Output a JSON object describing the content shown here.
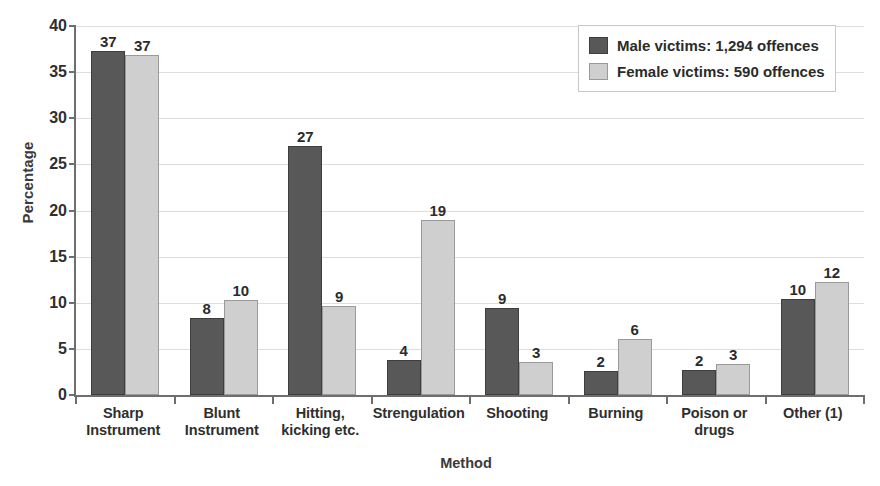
{
  "chart_data": {
    "type": "bar",
    "title": "",
    "xlabel": "Method",
    "ylabel": "Percentage",
    "ylim": [
      0,
      40
    ],
    "ytick_values": [
      0,
      5,
      10,
      15,
      20,
      25,
      30,
      35,
      40
    ],
    "ytick_labels": [
      "0",
      "5",
      "10",
      "15",
      "20",
      "25",
      "30",
      "35",
      "40"
    ],
    "grid": true,
    "legend_position": "top-right",
    "categories": [
      "Sharp Instrument",
      "Blunt Instrument",
      "Hitting, kicking etc.",
      "Strengulation",
      "Shooting",
      "Burning",
      "Poison or drugs",
      "Other (1)"
    ],
    "category_lines": [
      [
        "Sharp",
        "Instrument"
      ],
      [
        "Blunt",
        "Instrument"
      ],
      [
        "Hitting,",
        "kicking etc."
      ],
      [
        "Strengulation"
      ],
      [
        "Shooting"
      ],
      [
        "Burning"
      ],
      [
        "Poison or",
        "drugs"
      ],
      [
        "Other (1)"
      ]
    ],
    "series": [
      {
        "name": "Male victims: 1,294 offences",
        "short_name": "Male victims",
        "color": "#585858",
        "values": [
          37.3,
          8.3,
          27.0,
          3.8,
          9.4,
          2.6,
          2.7,
          10.4
        ],
        "labels": [
          "37",
          "8",
          "27",
          "4",
          "9",
          "2",
          "2",
          "10"
        ]
      },
      {
        "name": "Female victims: 590 offences",
        "short_name": "Female victims",
        "color": "#cfcfcf",
        "values": [
          36.9,
          10.3,
          9.7,
          19.0,
          3.6,
          6.1,
          3.4,
          12.2
        ],
        "labels": [
          "37",
          "10",
          "9",
          "19",
          "3",
          "6",
          "3",
          "12"
        ]
      }
    ]
  },
  "legend": {
    "items": [
      {
        "label": "Male victims: 1,294 offences",
        "swatch": "male"
      },
      {
        "label": "Female victims: 590 offences",
        "swatch": "female"
      }
    ]
  },
  "colors": {
    "male_bar": "#585858",
    "female_bar": "#cfcfcf",
    "axis": "#6e6e6e",
    "grid": "#dedede",
    "text": "#2b2b2b",
    "background": "#ffffff"
  }
}
